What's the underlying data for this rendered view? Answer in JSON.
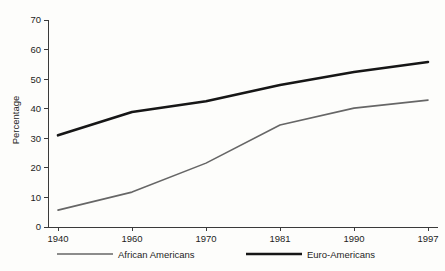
{
  "chart_data": {
    "type": "line",
    "title": "",
    "subtitle": "",
    "xlabel": "",
    "ylabel": "Percentage",
    "categories": [
      "1940",
      "1960",
      "1970",
      "1981",
      "1990",
      "1997"
    ],
    "x": [
      1940,
      1960,
      1970,
      1981,
      1990,
      1997
    ],
    "series": [
      {
        "name": "African Americans",
        "values": [
          5.7,
          11.8,
          21.6,
          34.5,
          40.2,
          42.9
        ],
        "color": "#666666",
        "line_width": 1.6,
        "legend_swatch": "line"
      },
      {
        "name": "Euro-Americans",
        "values": [
          31.0,
          38.9,
          42.5,
          48.0,
          52.4,
          55.8
        ],
        "color": "#161616",
        "line_width": 2.6,
        "legend_swatch": "line"
      }
    ],
    "ylim": [
      0,
      70
    ],
    "yticks": [
      0,
      10,
      20,
      30,
      40,
      50,
      60,
      70
    ],
    "ytick_labels": [
      "0",
      "10",
      "20",
      "30",
      "40",
      "50",
      "60",
      "70"
    ],
    "xtick_labels": [
      "1940",
      "1960",
      "1970",
      "1981",
      "1990",
      "1997"
    ],
    "grid": false,
    "legend_position": "bottom",
    "background_color": "#fdfdfb",
    "axis_color": "#3a3a3a",
    "text_color": "#1d1d1d"
  },
  "legend": {
    "items": [
      {
        "label": "African Americans",
        "color": "#666666",
        "width": 1.6
      },
      {
        "label": "Euro-Americans",
        "color": "#161616",
        "width": 2.6
      }
    ]
  }
}
